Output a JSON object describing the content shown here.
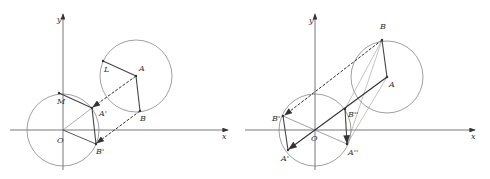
{
  "figures": [
    {
      "id": "left",
      "axes": {
        "x_label": "x",
        "y_label": "y",
        "origin_label": "O"
      },
      "points": {
        "O": {
          "label": "O",
          "x": 63,
          "y": 130,
          "lx": 57,
          "ly": 143
        },
        "A": {
          "label": "A",
          "x": 136,
          "y": 76,
          "lx": 139,
          "ly": 71
        },
        "L": {
          "label": "L",
          "x": 103,
          "y": 61,
          "lx": 104,
          "ly": 72
        },
        "B": {
          "label": "B",
          "x": 140,
          "y": 111,
          "lx": 140,
          "ly": 121
        },
        "M": {
          "label": "M",
          "x": 59,
          "y": 93,
          "lx": 57,
          "ly": 104
        },
        "A1": {
          "label": "A'",
          "x": 92,
          "y": 108,
          "lx": 99,
          "ly": 116
        },
        "B1": {
          "label": "B'",
          "x": 96,
          "y": 144,
          "lx": 96,
          "ly": 154
        }
      }
    },
    {
      "id": "right",
      "axes": {
        "x_label": "x",
        "y_label": "y",
        "origin_label": "O"
      },
      "points": {
        "O": {
          "label": "O",
          "x": 315,
          "y": 130,
          "lx": 311,
          "ly": 141
        },
        "B": {
          "label": "B",
          "x": 382,
          "y": 40,
          "lx": 380,
          "ly": 29
        },
        "A": {
          "label": "A",
          "x": 387,
          "y": 77,
          "lx": 389,
          "ly": 87
        },
        "B1": {
          "label": "B'",
          "x": 283,
          "y": 116,
          "lx": 272,
          "ly": 121
        },
        "A1": {
          "label": "A'",
          "x": 288,
          "y": 150,
          "lx": 281,
          "ly": 161
        },
        "B2": {
          "label": "B''",
          "x": 345,
          "y": 109,
          "lx": 348,
          "ly": 117
        },
        "A2": {
          "label": "A''",
          "x": 347,
          "y": 144,
          "lx": 348,
          "ly": 155
        }
      }
    }
  ]
}
